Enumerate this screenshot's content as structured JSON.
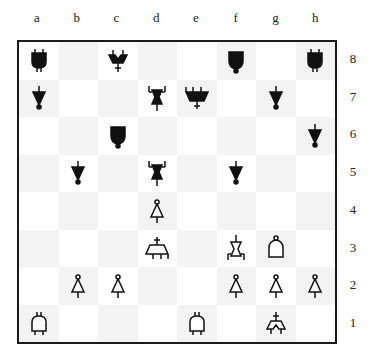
{
  "diagram": {
    "files": [
      "a",
      "b",
      "c",
      "d",
      "e",
      "f",
      "g",
      "h"
    ],
    "ranks": [
      "8",
      "7",
      "6",
      "5",
      "4",
      "3",
      "2",
      "1"
    ],
    "light_color": "#ffffff",
    "dark_color": "#f3f3f3",
    "border_color": "#1a1a1a"
  },
  "position": {
    "a8": "black-rook",
    "c8": "black-king",
    "f8": "black-bishop",
    "h8": "black-rook",
    "a7": "black-pawn",
    "d7": "black-knight",
    "e7": "black-queen",
    "g7": "black-pawn",
    "c6": "black-bishop",
    "h6": "black-pawn",
    "b5": "black-pawn",
    "d5": "black-knight",
    "f5": "black-pawn",
    "d4": "white-pawn",
    "d3": "white-queen",
    "f3": "white-knight",
    "g3": "white-bishop",
    "b2": "white-pawn",
    "c2": "white-pawn",
    "f2": "white-pawn",
    "g2": "white-pawn",
    "h2": "white-pawn",
    "a1": "white-rook",
    "e1": "white-rook",
    "g1": "white-king"
  }
}
